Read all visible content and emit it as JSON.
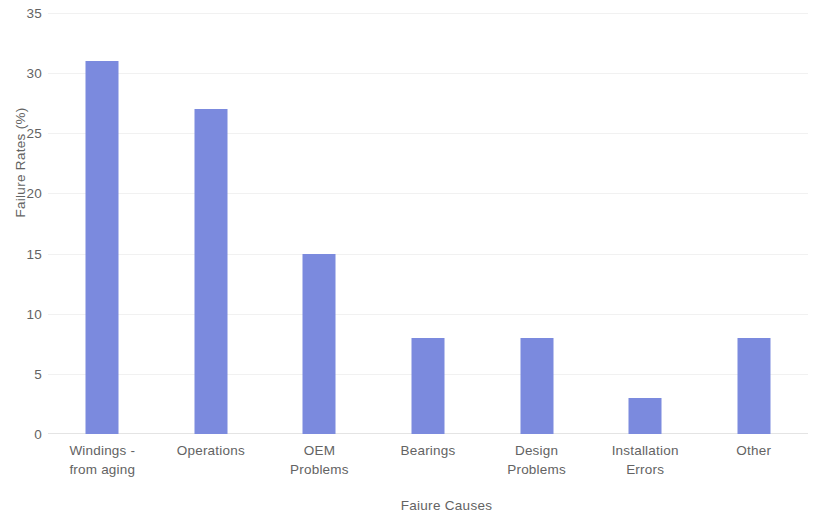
{
  "chart_data": {
    "type": "bar",
    "title": "",
    "xlabel": "Faiure Causes",
    "ylabel": "Failure Rates (%)",
    "categories": [
      "Windings - from aging",
      "Operations",
      "OEM Problems",
      "Bearings",
      "Design Problems",
      "Installation Errors",
      "Other"
    ],
    "category_lines": [
      [
        "Windings -",
        "from aging"
      ],
      [
        "Operations",
        ""
      ],
      [
        "OEM",
        "Problems"
      ],
      [
        "Bearings",
        ""
      ],
      [
        "Design",
        "Problems"
      ],
      [
        "Installation",
        "Errors"
      ],
      [
        "Other",
        ""
      ]
    ],
    "values": [
      31,
      27,
      15,
      8,
      8,
      3,
      8
    ],
    "ylim": [
      0,
      35
    ],
    "ytick_step": 5,
    "ytick_labels": [
      "0",
      "5",
      "10",
      "15",
      "20",
      "25",
      "30",
      "35"
    ],
    "ytick_values": [
      0,
      5,
      10,
      15,
      20,
      25,
      30,
      35
    ],
    "grid": true,
    "grid_axis": "y",
    "legend": false,
    "bar_color": "#7b8ade",
    "grid_color": "#f1f1f1",
    "text_color": "#636363",
    "background_color": "#ffffff"
  }
}
